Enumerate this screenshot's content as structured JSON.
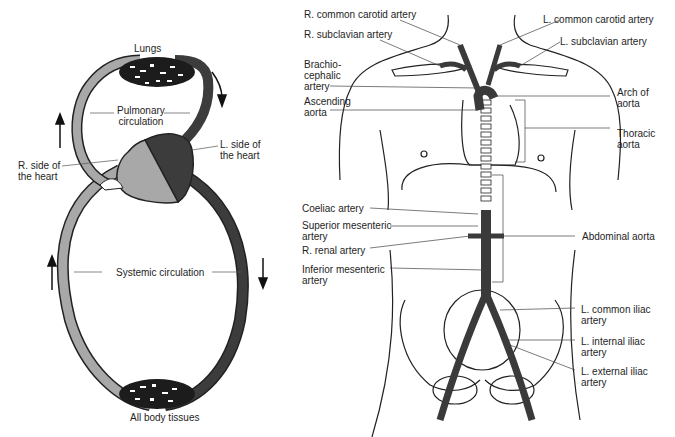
{
  "left_diagram": {
    "labels": {
      "lungs": "Lungs",
      "pulmonary": "Pulmonary\ncirculation",
      "r_heart": "R. side of\nthe heart",
      "l_heart": "L. side of\nthe heart",
      "systemic": "Systemic circulation",
      "tissues": "All body tissues"
    },
    "colors": {
      "deoxygenated": "#a8a8a8",
      "oxygenated": "#3c3c3c"
    }
  },
  "right_diagram": {
    "labels": {
      "r_common_carotid": "R. common carotid artery",
      "l_common_carotid": "L. common carotid artery",
      "r_subclavian": "R. subclavian artery",
      "l_subclavian": "L. subclavian artery",
      "brachiocephalic": "Brachio-\ncephalic\nartery",
      "ascending": "Ascending\naorta",
      "arch": "Arch of\naorta",
      "thoracic": "Thoracic\naorta",
      "coeliac": "Coeliac artery",
      "sup_mesenteric": "Superior mesenteric\nartery",
      "r_renal": "R. renal artery",
      "inf_mesenteric": "Inferior mesenteric\nartery",
      "abdominal": "Abdominal aorta",
      "l_common_iliac": "L. common iliac\nartery",
      "l_internal_iliac": "L. internal iliac\nartery",
      "l_external_iliac": "L. external iliac\nartery"
    },
    "colors": {
      "artery": "#3a3a3a"
    }
  }
}
